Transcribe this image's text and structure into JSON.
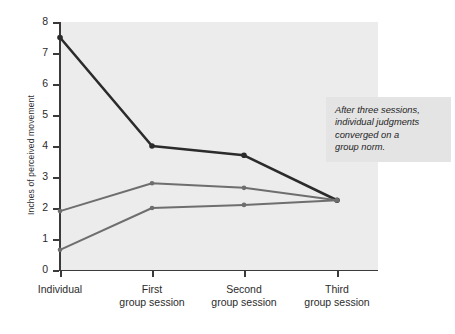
{
  "chart_data": {
    "type": "line",
    "title": "",
    "xlabel": "",
    "ylabel": "Inches of perceived movement",
    "categories": [
      "Individual",
      "First group session",
      "Second group session",
      "Third group session"
    ],
    "category_lines": [
      [
        "Individual",
        ""
      ],
      [
        "First",
        "group session"
      ],
      [
        "Second",
        "group session"
      ],
      [
        "Third",
        "group session"
      ]
    ],
    "ylim": [
      0,
      8
    ],
    "yticks": [
      0,
      1,
      2,
      3,
      4,
      5,
      6,
      7,
      8
    ],
    "ytick_labels": [
      "0",
      "1",
      "2",
      "3",
      "4",
      "5",
      "6",
      "7",
      "8"
    ],
    "grid": false,
    "legend": "none",
    "series": [
      {
        "name": "Participant 1",
        "values": [
          7.5,
          4.0,
          3.7,
          2.25
        ],
        "color": "#2b2b2b"
      },
      {
        "name": "Participant 2",
        "values": [
          1.9,
          2.8,
          2.65,
          2.25
        ],
        "color": "#6e6e6e"
      },
      {
        "name": "Participant 3",
        "values": [
          0.65,
          2.0,
          2.1,
          2.25
        ],
        "color": "#6e6e6e"
      }
    ],
    "annotations": [
      {
        "text": "After three sessions, individual judgments converged on a group norm."
      }
    ],
    "plot_background": "#ececec",
    "axis_color": "#3a3a3a"
  },
  "annotation": {
    "line1": "After three sessions,",
    "line2": "individual judgments",
    "line3": "converged on a",
    "line4": "group norm."
  }
}
